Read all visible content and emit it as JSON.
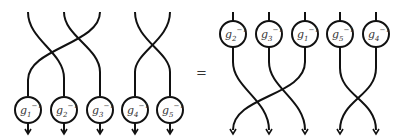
{
  "diagram": {
    "type": "string-diagram-braid-equation",
    "equals_sign": "=",
    "stroke_color": "#111111",
    "left_side": {
      "description": "Strands cross first, then pass through nodes at bottom",
      "nodes": [
        {
          "base": "g",
          "index": "1",
          "exponent": "−1"
        },
        {
          "base": "g",
          "index": "2",
          "exponent": "−1"
        },
        {
          "base": "g",
          "index": "3",
          "exponent": "−1"
        },
        {
          "base": "g",
          "index": "4",
          "exponent": "−1"
        },
        {
          "base": "g",
          "index": "5",
          "exponent": "−1"
        }
      ]
    },
    "right_side": {
      "description": "Nodes at top, then strands cross below",
      "nodes": [
        {
          "base": "g",
          "index": "2",
          "exponent": "−1"
        },
        {
          "base": "g",
          "index": "3",
          "exponent": "−1"
        },
        {
          "base": "g",
          "index": "1",
          "exponent": "−1"
        },
        {
          "base": "g",
          "index": "5",
          "exponent": "−1"
        },
        {
          "base": "g",
          "index": "4",
          "exponent": "−1"
        }
      ]
    }
  }
}
